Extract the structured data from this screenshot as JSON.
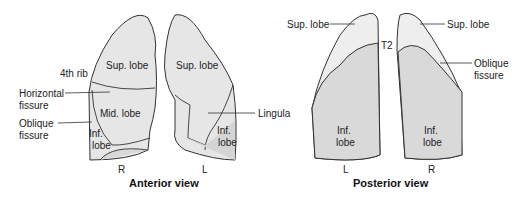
{
  "anterior": {
    "title": "Anterior view",
    "right_lung": {
      "side": "R",
      "labels": {
        "sup": "Sup. lobe",
        "mid": "Mid. lobe",
        "inf1": "Inf.",
        "inf2": "lobe"
      }
    },
    "left_lung": {
      "side": "L",
      "labels": {
        "sup": "Sup. lobe",
        "inf1": "Inf.",
        "inf2": "lobe"
      }
    },
    "callouts": {
      "rib": "4th rib",
      "horizontal1": "Horizontal",
      "horizontal2": "fissure",
      "oblique1": "Oblique",
      "oblique2": "fissure",
      "lingula": "Lingula"
    }
  },
  "posterior": {
    "title": "Posterior view",
    "left_lung": {
      "side": "L",
      "labels": {
        "sup": "Sup. lobe",
        "inf1": "Inf.",
        "inf2": "lobe"
      }
    },
    "right_lung": {
      "side": "R",
      "labels": {
        "sup": "Sup. lobe",
        "inf1": "Inf.",
        "inf2": "lobe"
      }
    },
    "callouts": {
      "t2": "T2",
      "oblique1": "Oblique",
      "oblique2": "fissure"
    }
  },
  "colors": {
    "upper": "#eeeeee",
    "lower": "#d9d9d9",
    "stroke": "#333333"
  }
}
